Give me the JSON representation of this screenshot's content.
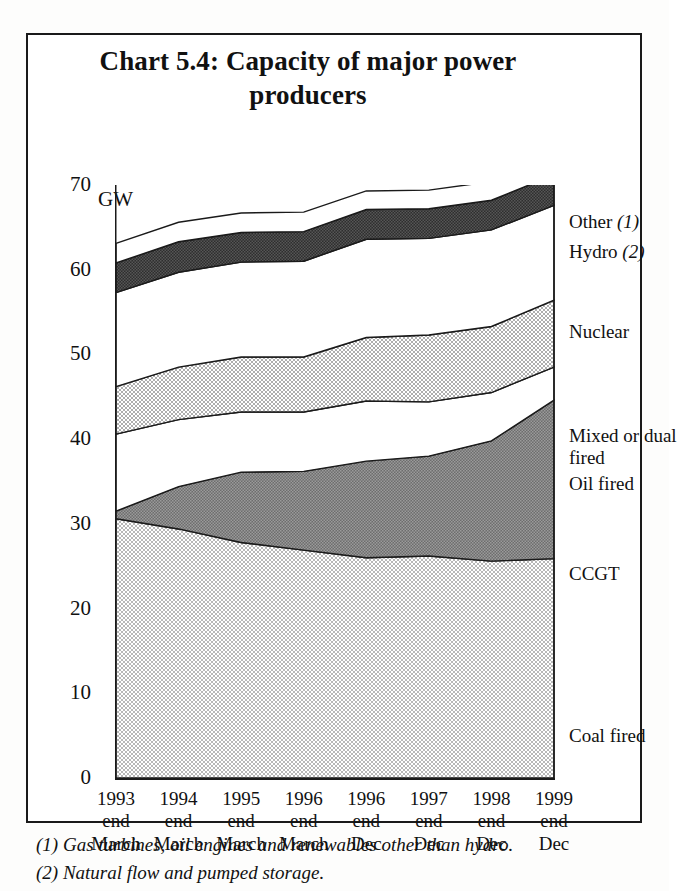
{
  "figure": {
    "title": "Chart 5.4: Capacity of major power producers",
    "title_line1": "Chart 5.4: Capacity of major power",
    "title_line2": "producers",
    "unit_label": "GW",
    "footnotes": [
      "(1) Gas turbines, oil engines and renewables other than hydro.",
      "(2) Natural flow and pumped storage."
    ]
  },
  "legend": {
    "items": [
      {
        "label": "Other",
        "note": "(1)",
        "key": "other"
      },
      {
        "label": "Hydro",
        "note": "(2)",
        "key": "hydro"
      },
      {
        "label": "Nuclear",
        "note": "",
        "key": "nuclear"
      },
      {
        "label": "Mixed or dual",
        "note": "",
        "key": "mixed1"
      },
      {
        "label": "fired",
        "note": "",
        "key": "mixed2"
      },
      {
        "label": "Oil fired",
        "note": "",
        "key": "oil"
      },
      {
        "label": "CCGT",
        "note": "",
        "key": "ccgt"
      },
      {
        "label": "Coal fired",
        "note": "",
        "key": "coal"
      }
    ]
  },
  "chart_data": {
    "type": "area",
    "stacked": true,
    "title": "Chart 5.4: Capacity of major power producers",
    "xlabel": "",
    "ylabel": "GW",
    "ylim": [
      0,
      70
    ],
    "yticks": [
      0,
      10,
      20,
      30,
      40,
      50,
      60,
      70
    ],
    "yticks_minor": [
      5,
      15,
      25,
      35,
      45,
      55,
      65
    ],
    "grid": false,
    "legend_position": "right",
    "categories": [
      "1993 end March",
      "1994 end March",
      "1995 end March",
      "1996 end March",
      "1996 end Dec",
      "1997 end Dec",
      "1998 end Dec",
      "1999 end Dec"
    ],
    "category_lines": [
      [
        "1993",
        "end",
        "March"
      ],
      [
        "1994",
        "end",
        "March"
      ],
      [
        "1995",
        "end",
        "March"
      ],
      [
        "1996",
        "end",
        "March"
      ],
      [
        "1996",
        "end",
        "Dec"
      ],
      [
        "1997",
        "end",
        "Dec"
      ],
      [
        "1998",
        "end",
        "Dec"
      ],
      [
        "1999",
        "end",
        "Dec"
      ]
    ],
    "series": [
      {
        "name": "Coal fired",
        "fill": "#cdcdcd",
        "values": [
          30.6,
          29.4,
          27.8,
          26.9,
          26.0,
          26.2,
          25.6,
          25.9
        ]
      },
      {
        "name": "CCGT",
        "fill": "#7a7a7a",
        "values": [
          0.9,
          5.0,
          8.3,
          9.3,
          11.4,
          11.8,
          14.2,
          18.7
        ]
      },
      {
        "name": "Oil fired",
        "fill": "#ffffff",
        "values": [
          9.1,
          7.9,
          7.1,
          7.0,
          7.1,
          6.4,
          5.7,
          3.9
        ]
      },
      {
        "name": "Mixed or dual fired",
        "fill": "#c2c2c2",
        "values": [
          5.6,
          6.2,
          6.5,
          6.5,
          7.5,
          7.9,
          7.8,
          7.9
        ]
      },
      {
        "name": "Nuclear",
        "fill": "#ffffff",
        "values": [
          11.1,
          11.2,
          11.2,
          11.3,
          11.6,
          11.4,
          11.4,
          11.2
        ]
      },
      {
        "name": "Hydro",
        "fill": "#3a3a3a",
        "values": [
          3.5,
          3.6,
          3.5,
          3.5,
          3.5,
          3.5,
          3.5,
          3.6
        ]
      },
      {
        "name": "Other",
        "fill": "#ffffff",
        "values": [
          2.3,
          2.3,
          2.3,
          2.3,
          2.2,
          2.2,
          2.2,
          2.5
        ]
      }
    ],
    "totals": [
      63.1,
      65.6,
      66.7,
      66.8,
      69.3,
      69.4,
      70.4,
      73.7
    ],
    "stack_tops": {
      "coal": [
        30.6,
        29.4,
        27.8,
        26.9,
        26.0,
        26.2,
        25.6,
        25.9
      ],
      "ccgt": [
        31.5,
        34.4,
        36.1,
        36.2,
        37.4,
        38.0,
        39.8,
        44.6
      ],
      "oil": [
        40.6,
        42.3,
        43.2,
        43.2,
        44.5,
        44.4,
        45.5,
        48.5
      ],
      "mixed": [
        46.2,
        48.5,
        49.7,
        49.7,
        52.0,
        52.3,
        53.3,
        56.4
      ],
      "nuclear": [
        57.3,
        59.7,
        60.9,
        61.0,
        63.6,
        63.7,
        64.7,
        67.6
      ],
      "hydro": [
        60.8,
        63.3,
        64.4,
        64.5,
        67.1,
        67.2,
        68.2,
        71.2
      ],
      "other": [
        63.1,
        65.6,
        66.7,
        66.8,
        69.3,
        69.4,
        70.4,
        73.7
      ]
    }
  }
}
